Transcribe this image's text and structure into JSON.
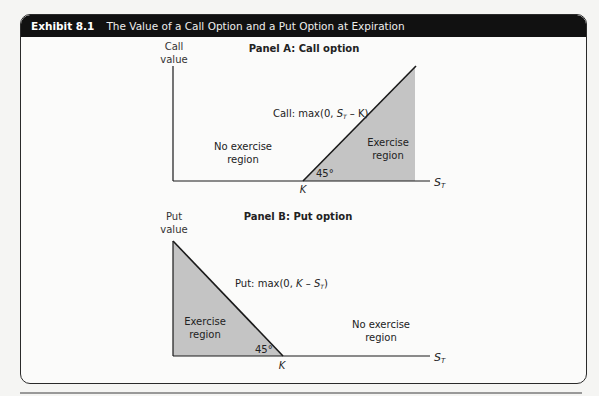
{
  "exhibit": {
    "number": "Exhibit 8.1",
    "title": "The Value of a Call Option and a Put Option at Expiration"
  },
  "panels": [
    {
      "title": "Panel A: Call option",
      "y_axis_label_line1": "Call",
      "y_axis_label_line2": "value",
      "x_axis_label": "S",
      "x_axis_subscript": "T",
      "strike_label": "K",
      "angle_label": "45°",
      "payoff_prefix": "Call: max(0, ",
      "payoff_var": "S",
      "payoff_sub": "T",
      "payoff_suffix": " – K)",
      "no_exercise_line1": "No exercise",
      "no_exercise_line2": "region",
      "exercise_line1": "Exercise",
      "exercise_line2": "region"
    },
    {
      "title": "Panel B: Put option",
      "y_axis_label_line1": "Put",
      "y_axis_label_line2": "value",
      "x_axis_label": "S",
      "x_axis_subscript": "T",
      "strike_label": "K",
      "angle_label": "45°",
      "payoff_prefix": "Put: max(0, ",
      "payoff_var": "K – S",
      "payoff_sub": "T",
      "payoff_suffix": ")",
      "no_exercise_line1": "No exercise",
      "no_exercise_line2": "region",
      "exercise_line1": "Exercise",
      "exercise_line2": "region"
    }
  ],
  "colors": {
    "header_bg": "#111111",
    "shade": "#c4c4c4",
    "line": "#1a1a1a"
  }
}
